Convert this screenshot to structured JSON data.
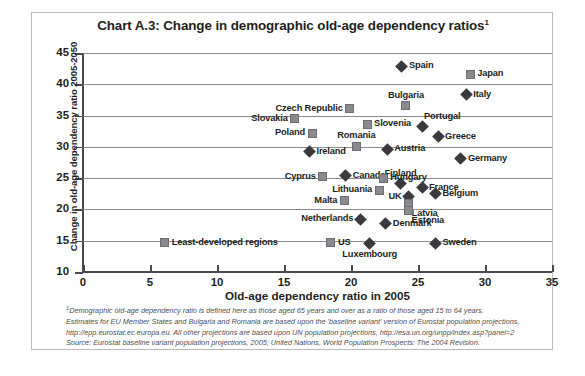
{
  "chart_data": {
    "type": "scatter",
    "title": "Chart A.3: Change in demographic old-age dependency ratios",
    "title_superscript": "1",
    "xlabel": "Old-age dependency ratio in 2005",
    "ylabel": "Change in old-age dependency ratio 2005-2050",
    "xlim": [
      0,
      35
    ],
    "ylim": [
      10,
      45
    ],
    "xticks": [
      0,
      5,
      10,
      15,
      20,
      25,
      30,
      35
    ],
    "yticks": [
      10,
      15,
      20,
      25,
      30,
      35,
      40,
      45
    ],
    "grid": "horizontal",
    "legend": "none (points labelled directly)",
    "series": [
      {
        "name": "EU Member States and other countries (diamond)",
        "marker": "diamond",
        "color": "#3a3a3e",
        "points": [
          {
            "label": "Spain",
            "x": 23.8,
            "y": 42.9,
            "label_pos": "right"
          },
          {
            "label": "Italy",
            "x": 28.6,
            "y": 38.3,
            "label_pos": "right"
          },
          {
            "label": "Portugal",
            "x": 25.3,
            "y": 33.3,
            "label_pos": "aboveright"
          },
          {
            "label": "Greece",
            "x": 26.5,
            "y": 31.6,
            "label_pos": "right"
          },
          {
            "label": "Austria",
            "x": 22.7,
            "y": 29.6,
            "label_pos": "right"
          },
          {
            "label": "Germany",
            "x": 28.2,
            "y": 28.1,
            "label_pos": "right"
          },
          {
            "label": "Ireland",
            "x": 16.9,
            "y": 29.2,
            "label_pos": "right"
          },
          {
            "label": "Canada",
            "x": 19.6,
            "y": 25.4,
            "label_pos": "right"
          },
          {
            "label": "Finland",
            "x": 23.7,
            "y": 24.1,
            "label_pos": "above"
          },
          {
            "label": "France",
            "x": 25.3,
            "y": 23.5,
            "label_pos": "right"
          },
          {
            "label": "Belgium",
            "x": 26.3,
            "y": 22.5,
            "label_pos": "right"
          },
          {
            "label": "UK",
            "x": 24.3,
            "y": 22.0,
            "label_pos": "left"
          },
          {
            "label": "Netherlands",
            "x": 20.7,
            "y": 18.4,
            "label_pos": "left"
          },
          {
            "label": "Denmark",
            "x": 22.6,
            "y": 17.7,
            "label_pos": "right"
          },
          {
            "label": "Luxembourg",
            "x": 21.4,
            "y": 14.6,
            "label_pos": "below"
          },
          {
            "label": "Sweden",
            "x": 26.3,
            "y": 14.6,
            "label_pos": "right"
          }
        ]
      },
      {
        "name": "Projected regions and other countries (square)",
        "marker": "square",
        "color": "#8a8a8e",
        "points": [
          {
            "label": "Japan",
            "x": 28.9,
            "y": 41.6,
            "label_pos": "right"
          },
          {
            "label": "Bulgaria",
            "x": 24.1,
            "y": 36.6,
            "label_pos": "above"
          },
          {
            "label": "Czech Republic",
            "x": 19.9,
            "y": 36.1,
            "label_pos": "left"
          },
          {
            "label": "Slovakia",
            "x": 15.8,
            "y": 34.5,
            "label_pos": "left"
          },
          {
            "label": "Slovenia",
            "x": 21.2,
            "y": 33.6,
            "label_pos": "right"
          },
          {
            "label": "Poland",
            "x": 17.1,
            "y": 32.2,
            "label_pos": "left"
          },
          {
            "label": "Romania",
            "x": 20.4,
            "y": 30.1,
            "label_pos": "above"
          },
          {
            "label": "Cyprus",
            "x": 17.9,
            "y": 25.2,
            "label_pos": "left"
          },
          {
            "label": "Hungary",
            "x": 22.4,
            "y": 25.0,
            "label_pos": "right"
          },
          {
            "label": "Lithuania",
            "x": 22.1,
            "y": 23.1,
            "label_pos": "left"
          },
          {
            "label": "Malta",
            "x": 19.5,
            "y": 21.4,
            "label_pos": "left"
          },
          {
            "label": "Latvia",
            "x": 24.3,
            "y": 20.9,
            "label_pos": "belowright"
          },
          {
            "label": "Estonia",
            "x": 24.3,
            "y": 19.8,
            "label_pos": "belowright"
          },
          {
            "label": "US",
            "x": 18.5,
            "y": 14.7,
            "label_pos": "right"
          },
          {
            "label": "Least-developed regions",
            "x": 6.1,
            "y": 14.7,
            "label_pos": "right"
          }
        ]
      }
    ]
  },
  "footnotes": {
    "superscript": "1",
    "line1": "Demographic old-age dependency ratio is defined here as those aged 65 years and over as a ratio of those aged 15 to 64 years.",
    "line2": "Estimates for EU Member States and Bulgaria and Romania are based upon the 'baseline variant' version of Eurostat population projections,",
    "line3": "http://epp.eurostat.ec.europa.eu. All other projections are based upon UN population projections, http://esa.un.org/unpp/index.asp?panel=2",
    "line4": "Source: Eurostat baseline variant population projections, 2005; United Nations, World Population Prospects: The 2004 Revision."
  }
}
